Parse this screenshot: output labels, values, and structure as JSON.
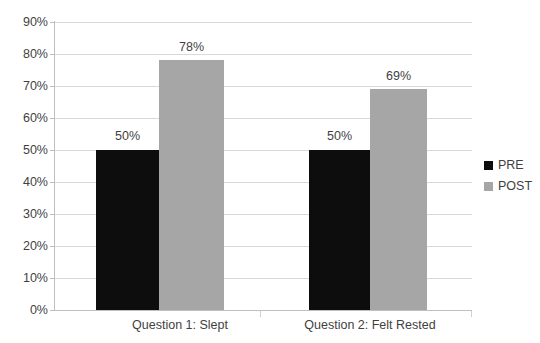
{
  "chart_data": {
    "type": "bar",
    "title": "",
    "subtitle": "",
    "xlabel": "",
    "ylabel": "",
    "categories": [
      "Question 1: Slept",
      "Question 2: Felt Rested"
    ],
    "series": [
      {
        "name": "PRE",
        "color": "#0d0d0d",
        "values": [
          50,
          50
        ]
      },
      {
        "name": "POST",
        "color": "#a6a6a6",
        "values": [
          78,
          69
        ]
      }
    ],
    "data_labels": [
      {
        "text": "50%",
        "series": "PRE",
        "category": "Question 1: Slept"
      },
      {
        "text": "78%",
        "series": "POST",
        "category": "Question 1: Slept"
      },
      {
        "text": "50%",
        "series": "PRE",
        "category": "Question 2: Felt Rested"
      },
      {
        "text": "69%",
        "series": "POST",
        "category": "Question 2: Felt Rested"
      }
    ],
    "ylim": [
      0,
      90
    ],
    "ytick_step": 10,
    "ytick_labels": [
      "0%",
      "10%",
      "20%",
      "30%",
      "40%",
      "50%",
      "60%",
      "70%",
      "80%",
      "90%"
    ],
    "grid": true,
    "grid_axis": "y",
    "legend_position": "right",
    "value_suffix": "%",
    "background_color": "#ffffff",
    "gridline_color": "#d9d9d9",
    "axis_color": "#bfbfbf"
  },
  "axis": {
    "y_ticks": [
      {
        "label": "90%",
        "value": 90
      },
      {
        "label": "80%",
        "value": 80
      },
      {
        "label": "70%",
        "value": 70
      },
      {
        "label": "60%",
        "value": 60
      },
      {
        "label": "50%",
        "value": 50
      },
      {
        "label": "40%",
        "value": 40
      },
      {
        "label": "30%",
        "value": 30
      },
      {
        "label": "20%",
        "value": 20
      },
      {
        "label": "10%",
        "value": 10
      },
      {
        "label": "0%",
        "value": 0
      }
    ]
  },
  "categories": [
    {
      "label": "Question 1: Slept"
    },
    {
      "label": "Question 2: Felt Rested"
    }
  ],
  "bars": [
    {
      "label": "50%",
      "series": "PRE",
      "category": "Question 1: Slept",
      "value": 50
    },
    {
      "label": "78%",
      "series": "POST",
      "category": "Question 1: Slept",
      "value": 78
    },
    {
      "label": "50%",
      "series": "PRE",
      "category": "Question 2: Felt Rested",
      "value": 50
    },
    {
      "label": "69%",
      "series": "POST",
      "category": "Question 2: Felt Rested",
      "value": 69
    }
  ],
  "legend": {
    "items": [
      {
        "label": "PRE",
        "color": "#0d0d0d"
      },
      {
        "label": "POST",
        "color": "#a6a6a6"
      }
    ]
  }
}
